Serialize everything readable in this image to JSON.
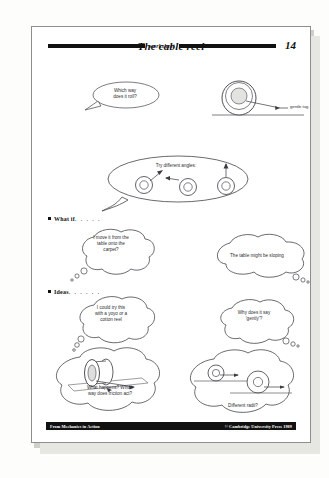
{
  "header": {
    "rule_word": "worksheet",
    "page_number": "14",
    "title": "The cable reel"
  },
  "figures": {
    "top_reel_label": "gentle tug",
    "angles_caption": "Try different angles:"
  },
  "sections": [
    {
      "id": "what-if",
      "label": "What if",
      "dots": ". . . . ."
    },
    {
      "id": "ideas",
      "label": "Ideas",
      "dots": ". . . . . ."
    }
  ],
  "bubbles": {
    "which_way": "Which way\ndoes it roll?",
    "carpet": "I move it from the\ntable onto the\ncarpet?",
    "sloping": "The table might be sloping",
    "yoyo": "I could try this\nwith a yoyo or a\ncotton reel",
    "gently": "Why does it say\n'gently'?",
    "friction": "What happens? Which\nway does friction act?",
    "radii": "Different radii?"
  },
  "footer": {
    "source": "From Mechanics in Action",
    "copyright": "© Cambridge University Press 1989"
  },
  "colors": {
    "ink": "#111111",
    "pencil": "#2b2b30",
    "paper": "#ffffff"
  }
}
